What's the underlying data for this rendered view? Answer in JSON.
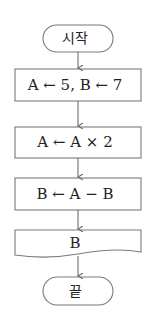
{
  "flowchart": {
    "start": {
      "label": "시작",
      "shape": "terminal"
    },
    "steps": [
      {
        "label": "A ← 5, B ← 7",
        "shape": "process"
      },
      {
        "label": "A ← A × 2",
        "shape": "process"
      },
      {
        "label": "B ← A − B",
        "shape": "process"
      }
    ],
    "output": {
      "label": "B",
      "shape": "document"
    },
    "end": {
      "label": "끝",
      "shape": "terminal"
    },
    "colors": {
      "stroke": "#7a7a7a",
      "text": "#222222",
      "arrow": "#6e6e6e"
    }
  }
}
